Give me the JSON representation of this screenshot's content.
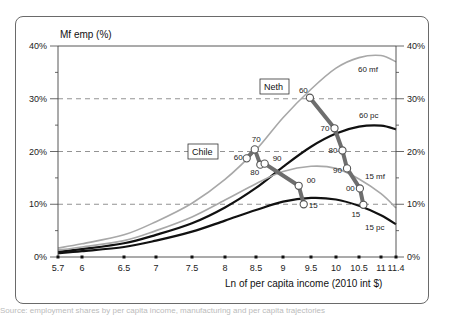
{
  "chart_data": {
    "type": "line",
    "title": "",
    "ylabel": "Mf emp (%)",
    "xlabel": "Ln of per capita income (2010 int $)",
    "xlim": [
      5.7,
      11.4
    ],
    "ylim": [
      0,
      40
    ],
    "x_ticks": [
      "5.7",
      "6",
      "6.5",
      "7",
      "7.5",
      "8",
      "8.5",
      "9",
      "9.5",
      "10",
      "10.5",
      "11",
      "11.4"
    ],
    "x_tick_values": [
      5.7,
      6,
      6.5,
      7,
      7.5,
      8,
      8.5,
      9,
      9.5,
      10,
      10.5,
      11,
      11.4
    ],
    "y_ticks_left": [
      "0%",
      "10%",
      "20%",
      "30%",
      "40%"
    ],
    "y_ticks_right": [
      "0%",
      "10%",
      "20%",
      "30%",
      "40%"
    ],
    "y_tick_values": [
      0,
      10,
      20,
      30,
      40
    ],
    "grid": "dashed horizontal at 10%, 20%, 30%",
    "series": [
      {
        "name": "60 mf",
        "color": "#a8a8a8",
        "width": 1.6,
        "points": [
          [
            5.7,
            1.7
          ],
          [
            6,
            2.5
          ],
          [
            6.5,
            4.2
          ],
          [
            7,
            6.7
          ],
          [
            7.5,
            10.2
          ],
          [
            8,
            14.7
          ],
          [
            8.5,
            20.3
          ],
          [
            9,
            26.4
          ],
          [
            9.5,
            31.8
          ],
          [
            10,
            35.8
          ],
          [
            10.5,
            37.8
          ],
          [
            11,
            38.2
          ],
          [
            11.4,
            37.0
          ]
        ]
      },
      {
        "name": "60 pc",
        "color": "#111111",
        "width": 2.2,
        "points": [
          [
            5.7,
            1.0
          ],
          [
            6,
            1.5
          ],
          [
            6.5,
            2.6
          ],
          [
            7,
            4.2
          ],
          [
            7.5,
            6.4
          ],
          [
            8,
            9.4
          ],
          [
            8.5,
            13.1
          ],
          [
            9,
            17.1
          ],
          [
            9.5,
            20.9
          ],
          [
            10,
            23.4
          ],
          [
            10.5,
            24.7
          ],
          [
            11,
            24.9
          ],
          [
            11.4,
            24.2
          ]
        ]
      },
      {
        "name": "15 mf",
        "color": "#a8a8a8",
        "width": 1.6,
        "points": [
          [
            5.7,
            1.3
          ],
          [
            6,
            1.9
          ],
          [
            6.5,
            3.1
          ],
          [
            7,
            5.0
          ],
          [
            7.5,
            7.6
          ],
          [
            8,
            10.8
          ],
          [
            8.5,
            13.9
          ],
          [
            9,
            16.2
          ],
          [
            9.5,
            17.2
          ],
          [
            10,
            16.8
          ],
          [
            10.5,
            14.8
          ],
          [
            11,
            12.0
          ],
          [
            11.4,
            9.3
          ]
        ]
      },
      {
        "name": "15 pc",
        "color": "#111111",
        "width": 2.2,
        "points": [
          [
            5.7,
            0.7
          ],
          [
            6,
            1.1
          ],
          [
            6.5,
            1.9
          ],
          [
            7,
            3.1
          ],
          [
            7.5,
            4.8
          ],
          [
            8,
            6.9
          ],
          [
            8.5,
            8.9
          ],
          [
            9,
            10.5
          ],
          [
            9.5,
            11.2
          ],
          [
            10,
            10.9
          ],
          [
            10.5,
            9.7
          ],
          [
            11,
            7.9
          ],
          [
            11.4,
            6.2
          ]
        ]
      }
    ],
    "trajectories": [
      {
        "country": "Chile",
        "points": [
          {
            "year": "60",
            "x": 8.35,
            "y": 18.7
          },
          {
            "year": "70",
            "x": 8.48,
            "y": 20.4
          },
          {
            "year": "80",
            "x": 8.58,
            "y": 17.5
          },
          {
            "year": "90",
            "x": 8.66,
            "y": 17.7
          },
          {
            "year": "00",
            "x": 9.28,
            "y": 13.5
          },
          {
            "year": "15",
            "x": 9.37,
            "y": 10.0
          }
        ]
      },
      {
        "country": "Neth",
        "points": [
          {
            "year": "60",
            "x": 9.48,
            "y": 30.2
          },
          {
            "year": "70",
            "x": 9.97,
            "y": 24.4
          },
          {
            "year": "80",
            "x": 10.14,
            "y": 20.2
          },
          {
            "year": "90",
            "x": 10.24,
            "y": 16.8
          },
          {
            "year": "00",
            "x": 10.52,
            "y": 13.0
          },
          {
            "year": "15",
            "x": 10.6,
            "y": 9.9
          }
        ]
      }
    ],
    "annotations": [
      "60 mf",
      "60 pc",
      "15 mf",
      "15 pc",
      "Chile",
      "Neth"
    ]
  },
  "labels": {
    "ylabel": "Mf emp (%)",
    "xlabel": "Ln of per capita income (2010 int $)",
    "curve_60mf": "60 mf",
    "curve_60pc": "60 pc",
    "curve_15mf": "15 mf",
    "curve_15pc": "15 pc",
    "chile": "Chile",
    "neth": "Neth"
  },
  "caption": "Source: employment shares by per capita income, manufacturing and per capita trajectories"
}
